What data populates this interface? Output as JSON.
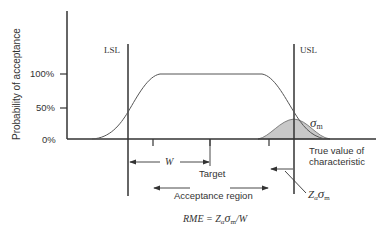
{
  "diagram": {
    "type": "acceptance-probability-curve",
    "y_axis_label": "Probability of acceptance",
    "y_ticks": [
      "100%",
      "50%",
      "0%"
    ],
    "x_axis_label_line1": "True value of",
    "x_axis_label_line2": "characteristic",
    "lsl_label": "LSL",
    "usl_label": "USL",
    "w_label": "W",
    "target_label": "Target",
    "acceptance_region_label": "Acceptance region",
    "sigma_label": "σ",
    "sigma_sub": "m",
    "z_label": "Z",
    "z_sub_alpha": "α",
    "formula_prefix": "RME = Z",
    "formula_alpha": "α",
    "formula_sigma": "σ",
    "formula_sub_m": "m",
    "formula_suffix": "/W",
    "colors": {
      "line": "#333333",
      "shaded": "#c8c8c8"
    }
  }
}
